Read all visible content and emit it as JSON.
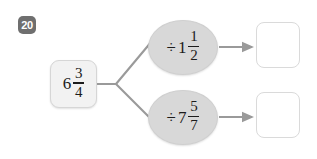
{
  "worksheet": {
    "question_number": "20",
    "start": {
      "whole": "6",
      "numerator": "3",
      "denominator": "4"
    },
    "branches": [
      {
        "operator": "÷",
        "whole": "1",
        "numerator": "1",
        "denominator": "2",
        "answer": ""
      },
      {
        "operator": "÷",
        "whole": "7",
        "numerator": "5",
        "denominator": "7",
        "answer": ""
      }
    ],
    "colors": {
      "background": "#ffffff",
      "badge": "#6f6f6f",
      "badge_text": "#ffffff",
      "start_box_fill": "#f2f2f2",
      "start_box_border": "#d6d6d6",
      "oval_fill": "#d8d8d8",
      "oval_border": "#cfcfcf",
      "answer_box_fill": "#ffffff",
      "answer_box_border": "#dadada",
      "connector": "#9a9a9a",
      "text": "#1c1c1c"
    }
  }
}
